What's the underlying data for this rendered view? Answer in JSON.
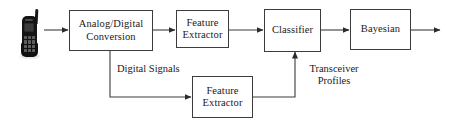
{
  "figure": {
    "type": "block-diagram",
    "background_color": "#ffffff",
    "line_color": "#3c3c3c",
    "text_color": "#1a1a1a"
  },
  "nodes": [
    {
      "id": "handset",
      "kind": "icon",
      "icon": "mobile-phone-icon",
      "label": ""
    },
    {
      "id": "analog_digital_conversion",
      "kind": "box",
      "lines": [
        "Analog/Digital",
        "Conversion"
      ]
    },
    {
      "id": "feature_extractor_top",
      "kind": "box",
      "lines": [
        "Feature",
        "Extractor"
      ]
    },
    {
      "id": "classifier",
      "kind": "box",
      "lines": [
        "Classifier"
      ]
    },
    {
      "id": "bayesian",
      "kind": "box",
      "lines": [
        "Bayesian"
      ]
    },
    {
      "id": "feature_extractor_bottom",
      "kind": "box",
      "lines": [
        "Feature",
        "Extractor"
      ]
    }
  ],
  "edge_labels": [
    {
      "id": "digital_signals",
      "text": "Digital Signals"
    },
    {
      "id": "transceiver_profiles",
      "lines": [
        "Transceiver",
        "Profiles"
      ]
    }
  ],
  "boxes": {
    "analog_digital_conversion": {
      "line1": "Analog/Digital",
      "line2": "Conversion"
    },
    "feature_extractor_top": {
      "line1": "Feature",
      "line2": "Extractor"
    },
    "classifier": {
      "line1": "Classifier"
    },
    "bayesian": {
      "line1": "Bayesian"
    },
    "feature_extractor_bottom": {
      "line1": "Feature",
      "line2": "Extractor"
    }
  },
  "labels": {
    "digital_signals": "Digital Signals",
    "transceiver_line1": "Transceiver",
    "transceiver_line2": "Profiles"
  },
  "connections": [
    {
      "from": "handset",
      "to": "analog_digital_conversion",
      "arrow": true
    },
    {
      "from": "analog_digital_conversion",
      "to": "feature_extractor_top",
      "arrow": true
    },
    {
      "from": "feature_extractor_top",
      "to": "classifier",
      "arrow": true
    },
    {
      "from": "classifier",
      "to": "bayesian",
      "arrow": true
    },
    {
      "from": "bayesian",
      "to": "output",
      "arrow": true
    },
    {
      "from": "analog_digital_conversion",
      "to": "feature_extractor_bottom",
      "arrow": true,
      "label": "Digital Signals"
    },
    {
      "from": "feature_extractor_bottom",
      "to": "classifier",
      "arrow": true,
      "label": "Transceiver Profiles"
    }
  ]
}
